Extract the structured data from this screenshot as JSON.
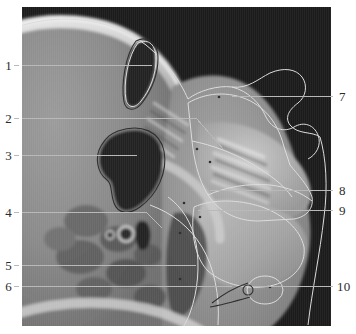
{
  "figure": {
    "kind": "labeled-anatomical-scan",
    "modality_appearance": "grayscale sagittal CT / radiograph of the skull base, paranasal sinus and nasopharyngeal region with hand-traced structure outlines",
    "panel": {
      "x": 22,
      "y": 7,
      "width": 309,
      "height": 319
    },
    "background_color": "#ffffff",
    "scan_background_color": "#1b1b1b",
    "leader_line_color": "#b9b9b9",
    "outline_color": "#d8d8d8",
    "number_color": "#2b2b2b"
  },
  "callouts": {
    "left": [
      {
        "id": "callout-1",
        "label": "1",
        "number_x": 7,
        "number_y": 59,
        "line_y": 65,
        "line_x_start": 22,
        "line_x_end": 152
      },
      {
        "id": "callout-2",
        "label": "2",
        "number_x": 7,
        "number_y": 112,
        "line_y": 118,
        "line_x_start": 22,
        "line_x_end": 196
      },
      {
        "id": "callout-3",
        "label": "3",
        "number_x": 7,
        "number_y": 149,
        "line_y": 155,
        "line_x_start": 22,
        "line_x_end": 137
      },
      {
        "id": "callout-4",
        "label": "4",
        "number_x": 7,
        "number_y": 206,
        "line_y": 212,
        "line_x_start": 22,
        "line_x_end": 146
      },
      {
        "id": "callout-5",
        "label": "5",
        "number_x": 7,
        "number_y": 259,
        "line_y": 265,
        "line_x_start": 22,
        "line_x_end": 196
      },
      {
        "id": "callout-6",
        "label": "6",
        "number_x": 7,
        "number_y": 280,
        "line_y": 286,
        "line_x_start": 22,
        "line_x_end": 232
      }
    ],
    "right": [
      {
        "id": "callout-7",
        "label": "7",
        "number_x": 339,
        "number_y": 90,
        "line_y": 96,
        "line_x_start": 232,
        "line_x_end": 333
      },
      {
        "id": "callout-8",
        "label": "8",
        "number_x": 339,
        "number_y": 184,
        "line_y": 190,
        "line_x_start": 210,
        "line_x_end": 333
      },
      {
        "id": "callout-9",
        "label": "9",
        "number_x": 339,
        "number_y": 204,
        "line_y": 210,
        "line_x_start": 198,
        "line_x_end": 333
      },
      {
        "id": "callout-10",
        "label": "10",
        "number_x": 339,
        "number_y": 280,
        "line_y": 286,
        "line_x_start": 252,
        "line_x_end": 333
      }
    ]
  }
}
